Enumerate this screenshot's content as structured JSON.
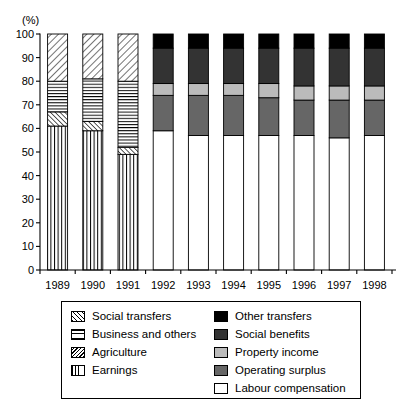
{
  "chart_data": {
    "type": "bar",
    "subtype": "stacked-percentage",
    "title": "",
    "xlabel": "",
    "ylabel": "(%)",
    "ylim": [
      0,
      100
    ],
    "ytick_step": 10,
    "yticks": [
      0,
      10,
      20,
      30,
      40,
      50,
      60,
      70,
      80,
      90,
      100
    ],
    "grid": false,
    "legend_position": "below-plot",
    "categories": [
      "1989",
      "1990",
      "1991",
      "1992",
      "1993",
      "1994",
      "1995",
      "1996",
      "1997",
      "1998"
    ],
    "series": [
      {
        "name": "Earnings",
        "pattern": "vertical-lines",
        "fill": "#ffffff",
        "values": [
          61,
          59,
          49,
          null,
          null,
          null,
          null,
          null,
          null,
          null
        ]
      },
      {
        "name": "Agriculture",
        "pattern": "diagonal-back-hatch",
        "fill": "#ffffff",
        "values": [
          6,
          4,
          3,
          null,
          null,
          null,
          null,
          null,
          null,
          null
        ]
      },
      {
        "name": "Business and others",
        "pattern": "horizontal-lines",
        "fill": "#ffffff",
        "values": [
          13,
          18,
          28,
          null,
          null,
          null,
          null,
          null,
          null,
          null
        ]
      },
      {
        "name": "Social transfers",
        "pattern": "diagonal-forward-hatch",
        "fill": "#ffffff",
        "values": [
          20,
          19,
          20,
          null,
          null,
          null,
          null,
          null,
          null,
          null
        ]
      },
      {
        "name": "Labour compensation",
        "pattern": "solid",
        "fill": "#ffffff",
        "values": [
          null,
          null,
          null,
          59,
          57,
          57,
          57,
          57,
          56,
          57
        ]
      },
      {
        "name": "Operating surplus",
        "pattern": "solid",
        "fill": "#666666",
        "values": [
          null,
          null,
          null,
          15,
          17,
          17,
          16,
          15,
          16,
          15
        ]
      },
      {
        "name": "Property income",
        "pattern": "solid",
        "fill": "#bbbbbb",
        "values": [
          null,
          null,
          null,
          5,
          5,
          5,
          6,
          6,
          6,
          6
        ]
      },
      {
        "name": "Social benefits",
        "pattern": "solid",
        "fill": "#333333",
        "values": [
          null,
          null,
          null,
          15,
          15,
          15,
          15,
          16,
          16,
          16
        ]
      },
      {
        "name": "Other transfers",
        "pattern": "solid",
        "fill": "#000000",
        "values": [
          null,
          null,
          null,
          6,
          6,
          6,
          6,
          6,
          6,
          6
        ]
      }
    ],
    "stack_order_bottom_to_top_left_bars": [
      "Earnings",
      "Agriculture",
      "Business and others",
      "Social transfers"
    ],
    "stack_order_bottom_to_top_right_bars": [
      "Labour compensation",
      "Operating surplus",
      "Property income",
      "Social benefits",
      "Other transfers"
    ]
  },
  "legend": {
    "left_column": [
      {
        "label": "Social transfers",
        "swatch": "social-transfers-swatch"
      },
      {
        "label": "Business and others",
        "swatch": "business-and-others-swatch"
      },
      {
        "label": "Agriculture",
        "swatch": "agriculture-swatch"
      },
      {
        "label": "Earnings",
        "swatch": "earnings-swatch"
      }
    ],
    "right_column": [
      {
        "label": "Other transfers",
        "swatch": "other-transfers-swatch",
        "color": "#000000"
      },
      {
        "label": "Social benefits",
        "swatch": "social-benefits-swatch",
        "color": "#333333"
      },
      {
        "label": "Property income",
        "swatch": "property-income-swatch",
        "color": "#bbbbbb"
      },
      {
        "label": "Operating surplus",
        "swatch": "operating-surplus-swatch",
        "color": "#666666"
      },
      {
        "label": "Labour compensation",
        "swatch": "labour-compensation-swatch",
        "color": "#ffffff"
      }
    ]
  },
  "axis": {
    "y_unit": "(%)",
    "y_tick_labels": [
      "100",
      "90",
      "80",
      "70",
      "60",
      "50",
      "40",
      "30",
      "20",
      "10",
      "0"
    ],
    "x_tick_labels": [
      "1989",
      "1990",
      "1991",
      "1992",
      "1993",
      "1994",
      "1995",
      "1996",
      "1997",
      "1998"
    ]
  }
}
